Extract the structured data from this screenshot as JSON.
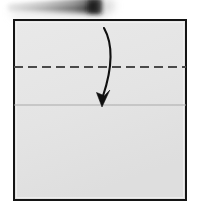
{
  "figure": {
    "title": "Origami fold step diagram",
    "caption": "Square sheet with horizontal valley-fold crease line and downward folding arrow",
    "background_color": "#ffffff",
    "width": 199,
    "height": 209
  },
  "photo_object": {
    "name": "blurred-dark-bar",
    "description": "Out-of-focus dark gray tapered bar at top of frame",
    "color_light": "#b4b4b4",
    "color_mid": "#8a8a8a",
    "color_dark": "#2e2e2e",
    "shadow_color": "#c9c9c9",
    "x_start": 8,
    "x_end": 101,
    "y_top": 0,
    "y_bottom": 14
  },
  "paper": {
    "name": "origami-square",
    "fill_color": "#e4e4e4",
    "border_color": "#141414",
    "border_width": 2,
    "left": 14,
    "top": 20,
    "right": 186,
    "bottom": 200,
    "inner_highlight_color": "#ececec"
  },
  "crease_line": {
    "name": "valley-fold-crease",
    "style": "dashed",
    "color": "#4a4a4a",
    "stroke_width": 2.2,
    "dash_length": 9,
    "gap_length": 5,
    "y": 67,
    "x_start": 14,
    "x_end": 186,
    "label": "Fold line (dashed)"
  },
  "edge_line": {
    "name": "folded-edge-line",
    "style": "solid",
    "color": "#a9a9a9",
    "stroke_width": 1.2,
    "y": 105,
    "x_start": 14,
    "x_end": 186,
    "label": "Paper edge (solid)"
  },
  "fold_arrow": {
    "name": "fold-direction-arrow",
    "color": "#101010",
    "stroke_width": 2.1,
    "direction": "downward-curved",
    "start_x": 104,
    "start_y": 28,
    "end_x": 103,
    "end_y": 96,
    "arrowhead_tip_x": 102,
    "arrowhead_tip_y": 107,
    "arrowhead_width": 11,
    "arrowhead_length": 16,
    "label": "Fold top edge down along dashed line"
  },
  "regions": {
    "upper_band_label": "Upper flap (above crease)",
    "middle_band_label": "Band between crease and edge",
    "lower_band_label": "Lower panel"
  }
}
